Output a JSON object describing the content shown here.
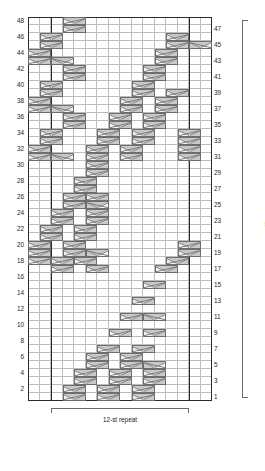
{
  "chart_data": {
    "type": "table",
    "rows": 48,
    "columns": 16,
    "row_numbers_left": [
      48,
      46,
      44,
      42,
      40,
      38,
      36,
      34,
      32,
      30,
      28,
      26,
      24,
      22,
      20,
      18,
      16,
      14,
      12,
      10,
      8,
      6,
      4,
      2
    ],
    "row_numbers_right": [
      47,
      45,
      43,
      41,
      39,
      37,
      35,
      33,
      31,
      29,
      27,
      25,
      23,
      21,
      19,
      17,
      15,
      13,
      11,
      9,
      7,
      5,
      3,
      1
    ],
    "row_repeat_label": "48-row repeat",
    "stitch_repeat_label": "12-st repeat",
    "stitch_repeat_start_col": 3,
    "stitch_repeat_end_col": 14,
    "heavy_separator_cols": [
      2,
      14
    ],
    "grid_color": "#bdbdbd",
    "frame_color": "#2b2b2b",
    "symbol_fill": "#c9c9c9",
    "symbol_stroke": "#6e6e6e",
    "symbol_note": "two-cell-wide cable cross; col is 0-based left edge, dir = right-cross or left-cross",
    "symbols": [
      {
        "row": 48,
        "col": 3,
        "dir": "right"
      },
      {
        "row": 47,
        "col": 3,
        "dir": "right"
      },
      {
        "row": 46,
        "col": 1,
        "dir": "right"
      },
      {
        "row": 45,
        "col": 1,
        "dir": "right"
      },
      {
        "row": 46,
        "col": 12,
        "dir": "right"
      },
      {
        "row": 45,
        "col": 12,
        "dir": "right"
      },
      {
        "row": 45,
        "col": 14,
        "dir": "left"
      },
      {
        "row": 44,
        "col": 0,
        "dir": "right"
      },
      {
        "row": 43,
        "col": 0,
        "dir": "right"
      },
      {
        "row": 43,
        "col": 2,
        "dir": "left"
      },
      {
        "row": 44,
        "col": 11,
        "dir": "right"
      },
      {
        "row": 43,
        "col": 11,
        "dir": "right"
      },
      {
        "row": 42,
        "col": 3,
        "dir": "right"
      },
      {
        "row": 41,
        "col": 3,
        "dir": "right"
      },
      {
        "row": 42,
        "col": 10,
        "dir": "right"
      },
      {
        "row": 41,
        "col": 10,
        "dir": "right"
      },
      {
        "row": 40,
        "col": 1,
        "dir": "right"
      },
      {
        "row": 39,
        "col": 1,
        "dir": "right"
      },
      {
        "row": 40,
        "col": 9,
        "dir": "right"
      },
      {
        "row": 39,
        "col": 9,
        "dir": "right"
      },
      {
        "row": 39,
        "col": 12,
        "dir": "right"
      },
      {
        "row": 38,
        "col": 0,
        "dir": "right"
      },
      {
        "row": 37,
        "col": 0,
        "dir": "right"
      },
      {
        "row": 37,
        "col": 2,
        "dir": "left"
      },
      {
        "row": 38,
        "col": 8,
        "dir": "right"
      },
      {
        "row": 37,
        "col": 8,
        "dir": "right"
      },
      {
        "row": 38,
        "col": 11,
        "dir": "right"
      },
      {
        "row": 37,
        "col": 11,
        "dir": "right"
      },
      {
        "row": 36,
        "col": 3,
        "dir": "right"
      },
      {
        "row": 35,
        "col": 3,
        "dir": "right"
      },
      {
        "row": 36,
        "col": 7,
        "dir": "right"
      },
      {
        "row": 35,
        "col": 7,
        "dir": "right"
      },
      {
        "row": 36,
        "col": 10,
        "dir": "right"
      },
      {
        "row": 35,
        "col": 10,
        "dir": "right"
      },
      {
        "row": 34,
        "col": 1,
        "dir": "right"
      },
      {
        "row": 33,
        "col": 1,
        "dir": "right"
      },
      {
        "row": 34,
        "col": 6,
        "dir": "right"
      },
      {
        "row": 33,
        "col": 6,
        "dir": "right"
      },
      {
        "row": 34,
        "col": 9,
        "dir": "right"
      },
      {
        "row": 33,
        "col": 9,
        "dir": "right"
      },
      {
        "row": 34,
        "col": 13,
        "dir": "right"
      },
      {
        "row": 33,
        "col": 13,
        "dir": "right"
      },
      {
        "row": 32,
        "col": 0,
        "dir": "right"
      },
      {
        "row": 31,
        "col": 0,
        "dir": "right"
      },
      {
        "row": 31,
        "col": 2,
        "dir": "left"
      },
      {
        "row": 32,
        "col": 5,
        "dir": "right"
      },
      {
        "row": 31,
        "col": 5,
        "dir": "right"
      },
      {
        "row": 32,
        "col": 8,
        "dir": "right"
      },
      {
        "row": 31,
        "col": 8,
        "dir": "right"
      },
      {
        "row": 32,
        "col": 13,
        "dir": "right"
      },
      {
        "row": 31,
        "col": 13,
        "dir": "right"
      },
      {
        "row": 30,
        "col": 5,
        "dir": "right"
      },
      {
        "row": 29,
        "col": 5,
        "dir": "right"
      },
      {
        "row": 28,
        "col": 4,
        "dir": "right"
      },
      {
        "row": 27,
        "col": 4,
        "dir": "right"
      },
      {
        "row": 26,
        "col": 3,
        "dir": "right"
      },
      {
        "row": 25,
        "col": 3,
        "dir": "right"
      },
      {
        "row": 26,
        "col": 5,
        "dir": "right"
      },
      {
        "row": 25,
        "col": 5,
        "dir": "left"
      },
      {
        "row": 24,
        "col": 2,
        "dir": "right"
      },
      {
        "row": 23,
        "col": 2,
        "dir": "right"
      },
      {
        "row": 24,
        "col": 5,
        "dir": "right"
      },
      {
        "row": 23,
        "col": 5,
        "dir": "right"
      },
      {
        "row": 22,
        "col": 1,
        "dir": "right"
      },
      {
        "row": 21,
        "col": 1,
        "dir": "right"
      },
      {
        "row": 22,
        "col": 4,
        "dir": "right"
      },
      {
        "row": 21,
        "col": 4,
        "dir": "right"
      },
      {
        "row": 20,
        "col": 0,
        "dir": "right"
      },
      {
        "row": 19,
        "col": 0,
        "dir": "right"
      },
      {
        "row": 20,
        "col": 3,
        "dir": "right"
      },
      {
        "row": 19,
        "col": 3,
        "dir": "right"
      },
      {
        "row": 19,
        "col": 5,
        "dir": "left"
      },
      {
        "row": 20,
        "col": 13,
        "dir": "right"
      },
      {
        "row": 19,
        "col": 13,
        "dir": "right"
      },
      {
        "row": 18,
        "col": 0,
        "dir": "right"
      },
      {
        "row": 18,
        "col": 2,
        "dir": "right"
      },
      {
        "row": 18,
        "col": 4,
        "dir": "right"
      },
      {
        "row": 18,
        "col": 12,
        "dir": "right"
      },
      {
        "row": 17,
        "col": 2,
        "dir": "right"
      },
      {
        "row": 17,
        "col": 5,
        "dir": "right"
      },
      {
        "row": 17,
        "col": 11,
        "dir": "right"
      },
      {
        "row": 15,
        "col": 10,
        "dir": "right"
      },
      {
        "row": 13,
        "col": 9,
        "dir": "right"
      },
      {
        "row": 11,
        "col": 8,
        "dir": "right"
      },
      {
        "row": 11,
        "col": 10,
        "dir": "left"
      },
      {
        "row": 9,
        "col": 7,
        "dir": "right"
      },
      {
        "row": 9,
        "col": 10,
        "dir": "right"
      },
      {
        "row": 7,
        "col": 6,
        "dir": "right"
      },
      {
        "row": 7,
        "col": 9,
        "dir": "right"
      },
      {
        "row": 6,
        "col": 5,
        "dir": "right"
      },
      {
        "row": 5,
        "col": 5,
        "dir": "right"
      },
      {
        "row": 6,
        "col": 8,
        "dir": "right"
      },
      {
        "row": 5,
        "col": 8,
        "dir": "right"
      },
      {
        "row": 5,
        "col": 10,
        "dir": "left"
      },
      {
        "row": 4,
        "col": 4,
        "dir": "right"
      },
      {
        "row": 3,
        "col": 4,
        "dir": "right"
      },
      {
        "row": 4,
        "col": 7,
        "dir": "right"
      },
      {
        "row": 3,
        "col": 7,
        "dir": "right"
      },
      {
        "row": 4,
        "col": 10,
        "dir": "right"
      },
      {
        "row": 3,
        "col": 10,
        "dir": "right"
      },
      {
        "row": 2,
        "col": 3,
        "dir": "right"
      },
      {
        "row": 1,
        "col": 3,
        "dir": "right"
      },
      {
        "row": 2,
        "col": 6,
        "dir": "right"
      },
      {
        "row": 1,
        "col": 6,
        "dir": "right"
      },
      {
        "row": 2,
        "col": 9,
        "dir": "right"
      },
      {
        "row": 1,
        "col": 9,
        "dir": "right"
      }
    ]
  }
}
